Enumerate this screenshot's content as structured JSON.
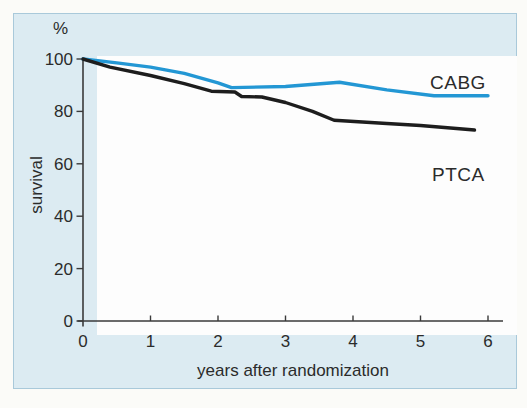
{
  "colors": {
    "page_bg": "#fbfbf8",
    "panel_bg": "#dcebf2",
    "panel_border": "#a9c9da",
    "plot_bg": "#fdfdfd",
    "axis": "#3a3a3a",
    "text": "#2b2b2b",
    "cabg_blue": "#2397d4",
    "ptca_black": "#1d1d1d"
  },
  "chart_data": {
    "type": "line",
    "title": "",
    "ylabel": "survival",
    "y_unit_label": "%",
    "xlabel": "years after randomization",
    "x_ticks": [
      0,
      1,
      2,
      3,
      4,
      5,
      6
    ],
    "y_ticks": [
      0,
      20,
      40,
      60,
      80,
      100
    ],
    "xlim": [
      0,
      6
    ],
    "ylim": [
      0,
      100
    ],
    "grid": false,
    "legend_position": "inline labels right of curve ends",
    "series": [
      {
        "name": "CABG",
        "color": "#2397d4",
        "points": [
          [
            0,
            100
          ],
          [
            0.5,
            98.5
          ],
          [
            1,
            96.9
          ],
          [
            1.5,
            94.5
          ],
          [
            2,
            90.9
          ],
          [
            2.2,
            89.1
          ],
          [
            3,
            89.5
          ],
          [
            3.8,
            91.1
          ],
          [
            4.5,
            88.2
          ],
          [
            5.2,
            86
          ],
          [
            6,
            86
          ]
        ]
      },
      {
        "name": "PTCA",
        "color": "#1d1d1d",
        "points": [
          [
            0,
            100
          ],
          [
            0.4,
            96.9
          ],
          [
            1,
            93.7
          ],
          [
            1.5,
            90.6
          ],
          [
            1.9,
            87.7
          ],
          [
            2.25,
            87.4
          ],
          [
            2.35,
            85.7
          ],
          [
            2.65,
            85.5
          ],
          [
            3,
            83.4
          ],
          [
            3.4,
            80
          ],
          [
            3.72,
            76.6
          ],
          [
            4.5,
            75.4
          ],
          [
            5,
            74.6
          ],
          [
            5.8,
            72.9
          ]
        ]
      }
    ]
  }
}
